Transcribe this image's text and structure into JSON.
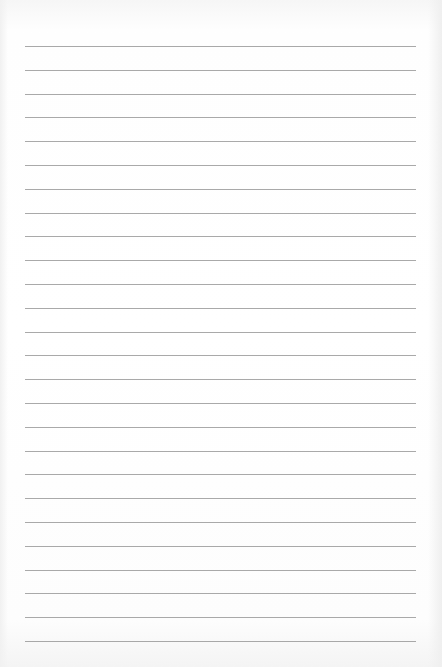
{
  "page": {
    "type": "lined-paper",
    "line_count": 26,
    "first_line_y": 46,
    "line_spacing": 23.8,
    "line_left": 25,
    "line_right": 416,
    "line_color": "#9a9a9a",
    "paper_color": "#ffffff"
  }
}
